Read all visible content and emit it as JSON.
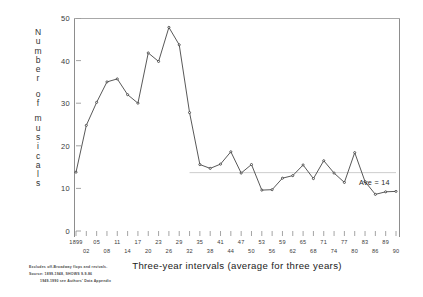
{
  "chart_data": {
    "type": "line",
    "title": "",
    "xlabel": "Three-year intervals (average for three years)",
    "ylabel": "Number of musicals",
    "ylim": [
      0,
      50
    ],
    "yticks": [
      0,
      10,
      20,
      30,
      40,
      50
    ],
    "grid": false,
    "legend": "none",
    "categories": [
      "1899",
      "02",
      "05",
      "08",
      "11",
      "14",
      "17",
      "20",
      "23",
      "26",
      "29",
      "32",
      "35",
      "38",
      "41",
      "44",
      "47",
      "50",
      "53",
      "56",
      "59",
      "62",
      "65",
      "68",
      "71",
      "74",
      "77",
      "80",
      "83",
      "86",
      "89",
      "90"
    ],
    "values": [
      13.8,
      24.8,
      30.2,
      35.0,
      35.7,
      32.0,
      30.0,
      41.8,
      39.8,
      47.8,
      43.7,
      27.8,
      15.6,
      14.7,
      15.7,
      18.6,
      13.6,
      15.6,
      9.6,
      9.7,
      12.4,
      13.0,
      15.5,
      12.3,
      16.5,
      13.6,
      11.4,
      18.4,
      11.6,
      8.6,
      9.2,
      9.3
    ],
    "annotations": [
      {
        "name": "average-line",
        "label": "Ave = 14",
        "value": 13.7,
        "type": "hline",
        "x_start_category": "32",
        "x_end_category": "90"
      }
    ]
  },
  "y_axis": {
    "title_letters": [
      "N",
      "u",
      "m",
      "b",
      "e",
      "r",
      "",
      "o",
      "f",
      "",
      "m",
      "u",
      "s",
      "i",
      "c",
      "a",
      "l",
      "s"
    ],
    "ticks": [
      "50",
      "40",
      "30",
      "20",
      "10",
      "0"
    ]
  },
  "x_axis": {
    "title": "Three-year intervals (average for three years)",
    "tick_labels": [
      "1899",
      "02",
      "05",
      "08",
      "11",
      "14",
      "17",
      "20",
      "23",
      "26",
      "29",
      "32",
      "35",
      "38",
      "41",
      "44",
      "47",
      "50",
      "53",
      "56",
      "59",
      "62",
      "65",
      "68",
      "71",
      "74",
      "77",
      "80",
      "83",
      "86",
      "89",
      "90"
    ]
  },
  "annotation": {
    "average_label": "Ave = 14"
  },
  "footnote": {
    "lines": [
      "Excludes off-Broadway flops and revivals.",
      "Source: 1899-1948, SHOWS 9-9-86",
      "1949-1990 see Authors' Data Appendix"
    ]
  },
  "colors": {
    "line": "#3a3a3a",
    "marker": "#2b2b2b",
    "axis": "#8d8d8d",
    "average_line": "#b6b6b6",
    "background": "#ffffff"
  }
}
